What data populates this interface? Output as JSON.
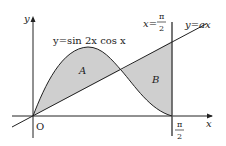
{
  "diagram": {
    "curve_label": "y=sin 2x cos x",
    "line_label": "y=ax",
    "vertical_line_label": {
      "lhs": "x=",
      "num": "π",
      "den": "2"
    },
    "x_axis_label": "x",
    "y_axis_label": "y",
    "origin_label": "O",
    "x_tick_label": {
      "num": "π",
      "den": "2"
    },
    "region_labels": [
      "A",
      "B"
    ],
    "colors": {
      "shade": "#cfcfcf",
      "stroke": "#222222",
      "background": "#ffffff"
    }
  }
}
